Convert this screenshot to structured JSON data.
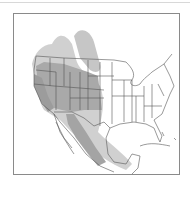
{
  "map": {
    "type": "range-map",
    "region": "North America (western US, Mexico)",
    "colors": {
      "background": "#ffffff",
      "frame": "#8a8a8a",
      "state_lines": "#555555",
      "range_light": "#c8c8c8",
      "range_dark": "#a8a8a8",
      "range_darkest": "#9a9a9a"
    },
    "layers": [
      {
        "name": "outer-range",
        "shade": "light"
      },
      {
        "name": "core-range",
        "shade": "dark"
      }
    ]
  }
}
